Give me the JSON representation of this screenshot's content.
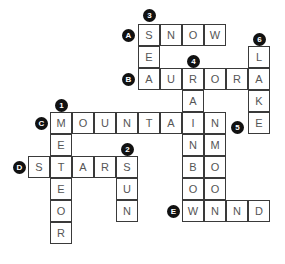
{
  "puzzle": {
    "cell_size": 22,
    "origin_x": 28,
    "origin_y": 24,
    "words": [
      {
        "id": "A",
        "direction": "across",
        "row": 0,
        "col": 5,
        "answer": "SNOW"
      },
      {
        "id": "B",
        "direction": "across",
        "row": 2,
        "col": 5,
        "answer": "AURORA"
      },
      {
        "id": "C",
        "direction": "across",
        "row": 4,
        "col": 1,
        "answer": "MOUNTAIN"
      },
      {
        "id": "D",
        "direction": "across",
        "row": 6,
        "col": 0,
        "answer": "STARS"
      },
      {
        "id": "E",
        "direction": "across",
        "row": 8,
        "col": 7,
        "answer": "WIND"
      },
      {
        "id": "1",
        "direction": "down",
        "row": 4,
        "col": 1,
        "answer": "METEOR"
      },
      {
        "id": "2",
        "direction": "down",
        "row": 6,
        "col": 4,
        "answer": "SUN"
      },
      {
        "id": "3",
        "direction": "down",
        "row": 0,
        "col": 5,
        "answer": "SEA"
      },
      {
        "id": "4",
        "direction": "down",
        "row": 2,
        "col": 7,
        "answer": "RAINBOW"
      },
      {
        "id": "5",
        "direction": "down",
        "row": 5,
        "col": 8,
        "answer": "MOON"
      },
      {
        "id": "6",
        "direction": "down",
        "row": 1,
        "col": 10,
        "answer": "LAKE"
      }
    ],
    "badges": [
      {
        "label": "A",
        "x": 122,
        "y": 29
      },
      {
        "label": "B",
        "x": 122,
        "y": 73
      },
      {
        "label": "C",
        "x": 35,
        "y": 117
      },
      {
        "label": "D",
        "x": 13,
        "y": 161
      },
      {
        "label": "E",
        "x": 167,
        "y": 205
      },
      {
        "label": "1",
        "x": 55,
        "y": 99
      },
      {
        "label": "2",
        "x": 121,
        "y": 143
      },
      {
        "label": "3",
        "x": 143,
        "y": 9
      },
      {
        "label": "4",
        "x": 187,
        "y": 55
      },
      {
        "label": "5",
        "x": 231,
        "y": 121
      },
      {
        "label": "6",
        "x": 253,
        "y": 33
      }
    ],
    "colors": {
      "border": "#3a3a3a",
      "letter": "#555555",
      "badge": "#111111",
      "badge_text": "#ffffff"
    }
  }
}
